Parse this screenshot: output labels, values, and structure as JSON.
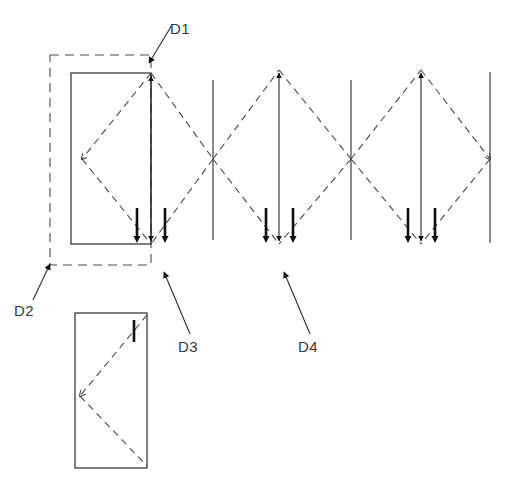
{
  "diagram": {
    "background_color": "#ffffff",
    "line_color": "#2b2b2b",
    "dashed_color": "#4a4a4a",
    "labels": [
      {
        "id": "D1",
        "text": "D1",
        "x": 170,
        "y": 34,
        "leader": {
          "x1": 163,
          "y1": 42,
          "x2": 149,
          "y2": 65
        }
      },
      {
        "id": "D2",
        "text": "D2",
        "x": 16,
        "y": 315,
        "leader": {
          "x1": 33,
          "y1": 300,
          "x2": 50,
          "y2": 265
        }
      },
      {
        "id": "D3",
        "text": "D3",
        "x": 178,
        "y": 351,
        "leader": {
          "x1": 186,
          "y1": 336,
          "x2": 163,
          "y2": 274
        }
      },
      {
        "id": "D4",
        "text": "D4",
        "x": 298,
        "y": 351,
        "leader": {
          "x1": 306,
          "y1": 336,
          "x2": 283,
          "y2": 274
        }
      }
    ],
    "dashed_outer_rect": {
      "x": 50,
      "y": 55,
      "width": 101,
      "height": 210
    },
    "panels": [
      {
        "name": "panel-upper",
        "x": 71,
        "y": 73,
        "width": 80,
        "height": 171
      },
      {
        "name": "panel-lower",
        "x": 75,
        "y": 313,
        "width": 72,
        "height": 155
      }
    ],
    "mullions": [
      {
        "name": "mullion-1",
        "x": 213,
        "y1": 80,
        "y2": 240
      },
      {
        "name": "mullion-2",
        "x": 351,
        "y1": 80,
        "y2": 240
      },
      {
        "name": "mullion-3",
        "x": 490,
        "y1": 72,
        "y2": 243
      }
    ],
    "diamonds": [
      {
        "name": "swing-diamond-1",
        "left_x": 151,
        "right_x": 213,
        "apex_x": 182,
        "top_y": 73,
        "mid_y": 159,
        "bottom_y": 244
      },
      {
        "name": "swing-diamond-2",
        "left_x": 213,
        "right_x": 279,
        "apex_x": 246,
        "top_y": 73,
        "mid_y": 159,
        "bottom_y": 244
      },
      {
        "name": "swing-diamond-3",
        "left_x": 279,
        "right_x": 351,
        "apex_x": 315,
        "top_y": 70,
        "mid_y": 159,
        "bottom_y": 244
      },
      {
        "name": "swing-diamond-4",
        "left_x": 351,
        "right_x": 421,
        "apex_x": 386,
        "top_y": 70,
        "mid_y": 159,
        "bottom_y": 244
      },
      {
        "name": "swing-diamond-5",
        "left_x": 421,
        "right_x": 490,
        "apex_x": 455,
        "top_y": 70,
        "mid_y": 159,
        "bottom_y": 244
      }
    ],
    "swing_arrow_groups": [
      {
        "name": "arrow-group-1",
        "center_x": 151,
        "tick_left_x": 137,
        "tick_right_x": 165,
        "tick_top_y": 208,
        "tick_bottom_y": 240,
        "arrow_top_y": 73,
        "arrow_bottom_y": 244
      },
      {
        "name": "arrow-group-2",
        "center_x": 279,
        "tick_left_x": 266,
        "tick_right_x": 293,
        "tick_top_y": 208,
        "tick_bottom_y": 240,
        "arrow_top_y": 70,
        "arrow_bottom_y": 244
      },
      {
        "name": "arrow-group-3",
        "center_x": 421,
        "tick_left_x": 408,
        "tick_right_x": 435,
        "tick_top_y": 208,
        "tick_bottom_y": 240,
        "arrow_top_y": 70,
        "arrow_bottom_y": 244
      }
    ],
    "lower_panel_tick": {
      "name": "lower-panel-tick",
      "x": 134,
      "y1": 320,
      "y2": 342
    }
  }
}
